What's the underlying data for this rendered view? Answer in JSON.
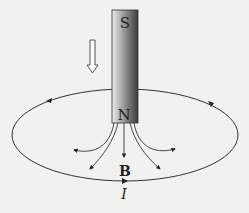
{
  "diagram": {
    "magnet": {
      "top_pole_label": "S",
      "bottom_pole_label": "N",
      "gradient_light": "#e6e6e6",
      "gradient_dark": "#3a3a3a"
    },
    "motion_arrow": {
      "direction": "down",
      "style": "hollow"
    },
    "loop": {
      "current_label": "I",
      "current_direction_bottom": "right"
    },
    "field": {
      "label": "B",
      "line_count": 5
    },
    "colors": {
      "background": "#f1f1f0",
      "stroke": "#333333"
    }
  }
}
